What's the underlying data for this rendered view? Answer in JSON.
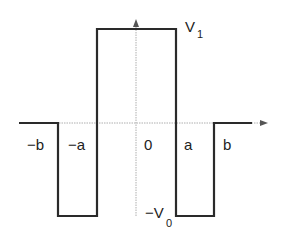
{
  "diagram": {
    "axis_labels": {
      "neg_b": "−b",
      "neg_a": "−a",
      "zero": "0",
      "a": "a",
      "b": "b"
    },
    "levels": {
      "top": {
        "main": "V",
        "sub": "1"
      },
      "bottom": {
        "prefix": "−V",
        "sub": "0"
      }
    },
    "colors": {
      "line": "#2a2a2a",
      "axis": "#9a9a9a"
    }
  }
}
